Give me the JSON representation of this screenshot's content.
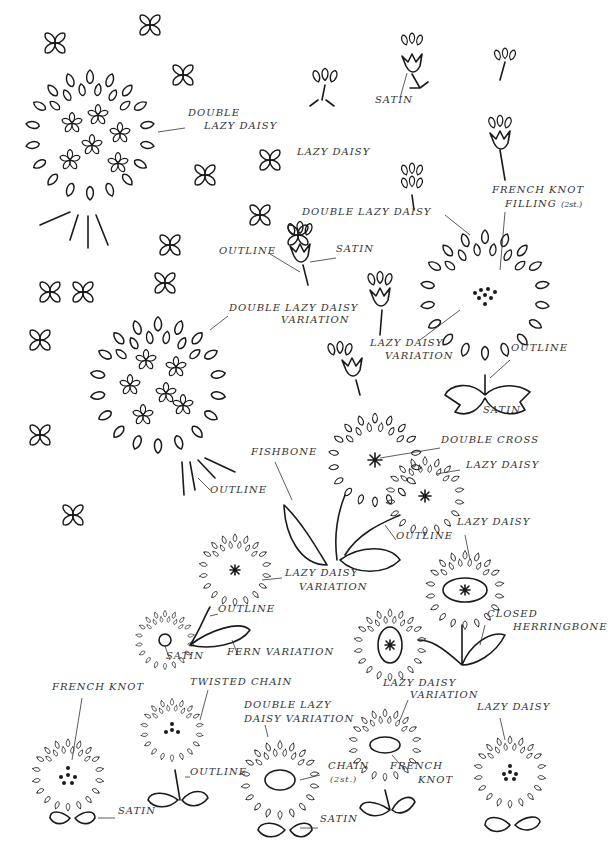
{
  "ink_color": "#1a1a1a",
  "background": "#ffffff",
  "labels": [
    {
      "id": "l1",
      "text": "DOUBLE",
      "x": 188,
      "y": 117
    },
    {
      "id": "l2",
      "text": "LAZY DAISY",
      "x": 204,
      "y": 130
    },
    {
      "id": "l3",
      "text": "LAZY DAISY",
      "x": 297,
      "y": 156
    },
    {
      "id": "l4",
      "text": "SATIN",
      "x": 375,
      "y": 104
    },
    {
      "id": "l5",
      "text": "FRENCH KNOT",
      "x": 492,
      "y": 194
    },
    {
      "id": "l6",
      "text": "FILLING",
      "x": 505,
      "y": 208,
      "suffix": "(2st.)"
    },
    {
      "id": "l7",
      "text": "DOUBLE LAZY DAISY",
      "x": 302,
      "y": 216
    },
    {
      "id": "l8",
      "text": "OUTLINE",
      "x": 219,
      "y": 255
    },
    {
      "id": "l9",
      "text": "SATIN",
      "x": 336,
      "y": 253
    },
    {
      "id": "l10",
      "text": "DOUBLE LAZY DAISY",
      "x": 229,
      "y": 312
    },
    {
      "id": "l11",
      "text": "VARIATION",
      "x": 281,
      "y": 324
    },
    {
      "id": "l12",
      "text": "LAZY DAISY",
      "x": 370,
      "y": 347
    },
    {
      "id": "l13",
      "text": "VARIATION",
      "x": 385,
      "y": 360
    },
    {
      "id": "l14",
      "text": "OUTLINE",
      "x": 511,
      "y": 352
    },
    {
      "id": "l15",
      "text": "SATIN",
      "x": 483,
      "y": 414
    },
    {
      "id": "l16",
      "text": "DOUBLE CROSS",
      "x": 441,
      "y": 444
    },
    {
      "id": "l17",
      "text": "FISHBONE",
      "x": 251,
      "y": 456
    },
    {
      "id": "l18",
      "text": "LAZY DAISY",
      "x": 466,
      "y": 469
    },
    {
      "id": "l19",
      "text": "OUTLINE",
      "x": 210,
      "y": 494
    },
    {
      "id": "l20",
      "text": "OUTLINE",
      "x": 396,
      "y": 540
    },
    {
      "id": "l21",
      "text": "LAZY DAISY",
      "x": 457,
      "y": 526
    },
    {
      "id": "l22",
      "text": "LAZY DAISY",
      "x": 285,
      "y": 577
    },
    {
      "id": "l23",
      "text": "VARIATION",
      "x": 299,
      "y": 591
    },
    {
      "id": "l24",
      "text": "OUTLINE",
      "x": 218,
      "y": 613
    },
    {
      "id": "l25",
      "text": "CLOSED",
      "x": 487,
      "y": 618
    },
    {
      "id": "l26",
      "text": "HERRINGBONE",
      "x": 513,
      "y": 631
    },
    {
      "id": "l27",
      "text": "SATIN",
      "x": 166,
      "y": 660
    },
    {
      "id": "l28",
      "text": "FERN VARIATION",
      "x": 227,
      "y": 656
    },
    {
      "id": "l29",
      "text": "LAZY DAISY",
      "x": 383,
      "y": 687
    },
    {
      "id": "l30",
      "text": "VARIATION",
      "x": 410,
      "y": 699
    },
    {
      "id": "l31",
      "text": "FRENCH KNOT",
      "x": 52,
      "y": 691
    },
    {
      "id": "l32",
      "text": "TWISTED CHAIN",
      "x": 190,
      "y": 686
    },
    {
      "id": "l33",
      "text": "DOUBLE LAZY",
      "x": 244,
      "y": 709
    },
    {
      "id": "l34",
      "text": "DAISY VARIATION",
      "x": 244,
      "y": 723
    },
    {
      "id": "l35",
      "text": "LAZY DAISY",
      "x": 477,
      "y": 711
    },
    {
      "id": "l36",
      "text": "OUTLINE",
      "x": 190,
      "y": 776
    },
    {
      "id": "l37",
      "text": "CHAIN",
      "x": 328,
      "y": 770
    },
    {
      "id": "l38",
      "text": "(2st.)",
      "x": 330,
      "y": 784,
      "small": true
    },
    {
      "id": "l39",
      "text": "FRENCH",
      "x": 390,
      "y": 770
    },
    {
      "id": "l40",
      "text": "KNOT",
      "x": 418,
      "y": 784
    },
    {
      "id": "l41",
      "text": "SATIN",
      "x": 118,
      "y": 815
    },
    {
      "id": "l42",
      "text": "SATIN",
      "x": 320,
      "y": 823
    }
  ]
}
